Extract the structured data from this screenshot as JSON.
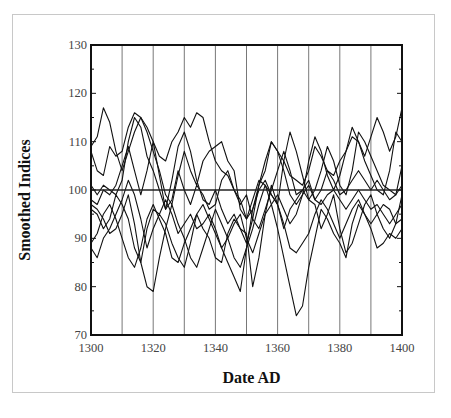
{
  "chart_data": {
    "type": "line",
    "title": "",
    "xlabel": "Date AD",
    "ylabel": "Smoothed Indices",
    "xlim": [
      1300,
      1400
    ],
    "ylim": [
      70,
      130
    ],
    "x_ticks": [
      1300,
      1320,
      1340,
      1360,
      1380,
      1400
    ],
    "x_tick_labels": [
      "1300",
      "1320",
      "1340",
      "1360",
      "1380",
      "1400"
    ],
    "y_ticks": [
      70,
      80,
      90,
      100,
      110,
      120,
      130
    ],
    "y_tick_labels": [
      "70",
      "80",
      "90",
      "100",
      "110",
      "120",
      "130"
    ],
    "vertical_gridlines": [
      1310,
      1320,
      1330,
      1340,
      1350,
      1360,
      1370,
      1380,
      1390
    ],
    "reference_line": 100,
    "legend": "none",
    "x": [
      1300,
      1302,
      1304,
      1306,
      1308,
      1310,
      1312,
      1314,
      1316,
      1318,
      1320,
      1322,
      1324,
      1326,
      1328,
      1330,
      1332,
      1334,
      1336,
      1338,
      1340,
      1342,
      1344,
      1346,
      1348,
      1350,
      1352,
      1354,
      1356,
      1358,
      1360,
      1362,
      1364,
      1366,
      1368,
      1370,
      1372,
      1374,
      1376,
      1378,
      1380,
      1382,
      1384,
      1386,
      1388,
      1390,
      1392,
      1394,
      1396,
      1398,
      1400
    ],
    "series": [
      {
        "name": "series-1",
        "values": [
          109,
          111,
          117,
          114,
          108,
          104,
          108,
          112,
          115,
          113,
          110,
          107,
          106,
          110,
          112,
          115,
          113,
          116,
          115,
          110,
          106,
          104,
          103,
          100,
          98,
          94,
          96,
          101,
          104,
          110,
          108,
          106,
          103,
          102,
          101,
          104,
          109,
          107,
          104,
          103,
          106,
          108,
          111,
          110,
          107,
          111,
          115,
          112,
          108,
          111,
          117
        ]
      },
      {
        "name": "series-2",
        "values": [
          108,
          104,
          103,
          109,
          107,
          108,
          113,
          116,
          115,
          112,
          108,
          104,
          99,
          97,
          103,
          108,
          104,
          101,
          106,
          108,
          109,
          110,
          106,
          104,
          96,
          94,
          98,
          102,
          101,
          99,
          97,
          106,
          112,
          108,
          103,
          98,
          100,
          104,
          109,
          106,
          101,
          99,
          104,
          112,
          110,
          107,
          104,
          101,
          100,
          99,
          105
        ]
      },
      {
        "name": "series-3",
        "values": [
          101,
          99,
          101,
          100,
          99,
          102,
          110,
          115,
          113,
          107,
          104,
          100,
          96,
          102,
          109,
          112,
          108,
          102,
          98,
          97,
          100,
          96,
          93,
          95,
          92,
          89,
          94,
          101,
          106,
          110,
          108,
          104,
          99,
          97,
          99,
          106,
          111,
          108,
          103,
          100,
          103,
          108,
          113,
          110,
          106,
          103,
          100,
          99,
          104,
          112,
          110
        ]
      },
      {
        "name": "series-4",
        "values": [
          98,
          97,
          100,
          99,
          101,
          105,
          109,
          104,
          99,
          104,
          110,
          103,
          96,
          98,
          104,
          100,
          97,
          101,
          99,
          96,
          97,
          102,
          104,
          100,
          97,
          99,
          94,
          92,
          96,
          100,
          104,
          108,
          104,
          99,
          100,
          102,
          98,
          100,
          104,
          102,
          99,
          100,
          102,
          104,
          102,
          100,
          102,
          100,
          98,
          99,
          101
        ]
      },
      {
        "name": "series-5",
        "values": [
          96,
          95,
          92,
          94,
          99,
          97,
          94,
          88,
          85,
          92,
          96,
          95,
          98,
          95,
          91,
          93,
          95,
          92,
          93,
          95,
          92,
          88,
          90,
          93,
          95,
          90,
          87,
          91,
          95,
          97,
          99,
          96,
          93,
          95,
          99,
          101,
          98,
          97,
          99,
          100,
          98,
          96,
          98,
          100,
          98,
          96,
          97,
          95,
          93,
          95,
          97
        ]
      },
      {
        "name": "series-6",
        "values": [
          89,
          91,
          95,
          97,
          94,
          90,
          86,
          84,
          88,
          94,
          97,
          94,
          91,
          86,
          85,
          89,
          92,
          95,
          92,
          90,
          86,
          85,
          91,
          94,
          92,
          91,
          80,
          86,
          95,
          101,
          97,
          92,
          96,
          98,
          100,
          98,
          97,
          92,
          95,
          99,
          92,
          87,
          89,
          93,
          97,
          99,
          95,
          92,
          90,
          93,
          99
        ]
      },
      {
        "name": "series-7",
        "values": [
          97,
          96,
          94,
          91,
          92,
          95,
          99,
          93,
          85,
          80,
          79,
          86,
          92,
          97,
          93,
          90,
          86,
          84,
          88,
          92,
          96,
          93,
          90,
          86,
          84,
          88,
          92,
          97,
          101,
          97,
          92,
          86,
          80,
          74,
          76,
          84,
          90,
          96,
          94,
          91,
          89,
          86,
          93,
          97,
          95,
          92,
          88,
          89,
          91,
          90,
          92
        ]
      },
      {
        "name": "series-8",
        "values": [
          88,
          86,
          90,
          92,
          95,
          98,
          102,
          99,
          94,
          88,
          92,
          95,
          93,
          89,
          86,
          84,
          89,
          95,
          97,
          94,
          91,
          88,
          85,
          82,
          79,
          88,
          96,
          100,
          102,
          99,
          97,
          93,
          88,
          87,
          89,
          91,
          95,
          98,
          96,
          93,
          90,
          93,
          96,
          98,
          95,
          93,
          95,
          97,
          96,
          93,
          94
        ]
      }
    ]
  }
}
